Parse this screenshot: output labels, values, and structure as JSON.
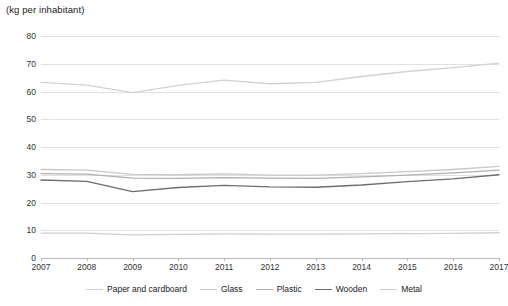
{
  "chart_data": {
    "type": "line",
    "title": "(kg per inhabitant)",
    "xlabel": "",
    "ylabel": "(kg per inhabitant)",
    "categories": [
      "2007",
      "2008",
      "2009",
      "2010",
      "2011",
      "2012",
      "2013",
      "2014",
      "2015",
      "2016",
      "2017"
    ],
    "x": [
      2007,
      2008,
      2009,
      2010,
      2011,
      2012,
      2013,
      2014,
      2015,
      2016,
      2017
    ],
    "ylim": [
      0,
      80
    ],
    "yticks": [
      0,
      10,
      20,
      30,
      40,
      50,
      60,
      70,
      80
    ],
    "ytick_labels": [
      "0",
      "10",
      "20",
      "30",
      "40",
      "50",
      "60",
      "70",
      "80"
    ],
    "grid": true,
    "legend_position": "bottom",
    "series": [
      {
        "name": "Paper and cardboard",
        "color": "#d2d2d2",
        "width": 1.3,
        "values": [
          63.3,
          62.3,
          59.6,
          62.2,
          64.1,
          62.8,
          63.3,
          65.4,
          67.2,
          68.6,
          70.2
        ]
      },
      {
        "name": "Glass",
        "color": "#c8c8c8",
        "width": 1.3,
        "values": [
          31.9,
          31.7,
          30.1,
          30.0,
          30.3,
          29.9,
          29.9,
          30.4,
          31.1,
          31.9,
          33.0
        ]
      },
      {
        "name": "Plastic",
        "color": "#b0b0b0",
        "width": 1.3,
        "values": [
          30.4,
          30.2,
          28.8,
          28.7,
          29.0,
          28.8,
          28.7,
          29.2,
          29.9,
          30.7,
          31.7
        ]
      },
      {
        "name": "Wooden",
        "color": "#6e6e6e",
        "width": 1.3,
        "values": [
          28.1,
          27.6,
          23.9,
          25.4,
          26.2,
          25.6,
          25.5,
          26.3,
          27.5,
          28.5,
          30.0
        ]
      },
      {
        "name": "Metal",
        "color": "#cfcfcf",
        "width": 1.3,
        "values": [
          9.0,
          9.0,
          8.3,
          8.5,
          8.7,
          8.6,
          8.6,
          8.7,
          8.8,
          8.9,
          9.1
        ]
      }
    ]
  }
}
